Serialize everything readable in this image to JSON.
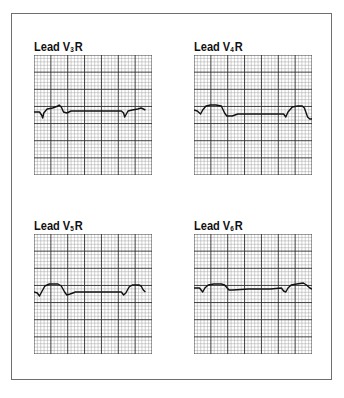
{
  "figure": {
    "panels": [
      {
        "id": "v3r",
        "label": {
          "prefix": "Lead V",
          "sub": "3",
          "suffix": "R"
        },
        "trace": "0,19 5,19 7,22 8,25 9,20 12,16 17,15 22,13 23,12 25,14 27,19 30,20 34,18 40,18 60,18 80,18 82,20 83,24 84,22 86,18 90,17 95,16 98,15 100,16 102,17"
      },
      {
        "id": "v4r",
        "label": {
          "prefix": "Lead V",
          "sub": "4",
          "suffix": "R"
        },
        "trace": "0,17 3,18 6,21 8,17 11,13 15,12 20,12 25,13 28,20 30,23 35,23 40,21 50,21 60,21 70,21 82,21 84,24 86,19 90,14 95,13 99,13 101,15 104,24 106,26 108,26"
      },
      {
        "id": "v5r",
        "label": {
          "prefix": "Lead V",
          "sub": "5",
          "suffix": "R"
        },
        "trace": "0,20 3,21 5,24 7,20 10,14 14,12 22,12 25,14 28,20 30,23 33,22 38,20 50,20 60,20 70,20 80,20 82,23 84,21 87,15 90,13 96,13 98,14 100,18 102,20"
      },
      {
        "id": "v6r",
        "label": {
          "prefix": "Lead V",
          "sub": "6",
          "suffix": "R"
        },
        "trace": "0,16 5,16 8,20 10,16 13,13 18,12 25,12 28,13 32,18 35,18 50,17 60,17 70,17 80,16 82,19 84,20 86,16 89,13 94,12 100,11 103,13 106,16 108,17"
      }
    ],
    "grid": {
      "major_cols": 7,
      "major_rows": 7,
      "minor_per_major": 5
    },
    "colors": {
      "minor_line": "#9a9a9a",
      "major_line": "#2a2a2a",
      "trace": "#111111",
      "frame": "#6e6e6e"
    }
  }
}
